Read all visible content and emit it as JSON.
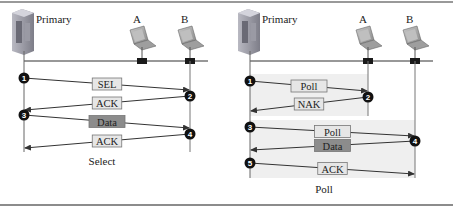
{
  "panels": [
    {
      "id": "select",
      "caption": "Select",
      "primary_label": "Primary",
      "stations": [
        {
          "label": "A"
        },
        {
          "label": "B"
        }
      ],
      "messages": [
        {
          "step": "1",
          "text": "SEL",
          "from": "Primary",
          "to": "B",
          "style": "light"
        },
        {
          "step": "2",
          "text": "ACK",
          "from": "B",
          "to": "Primary",
          "style": "light"
        },
        {
          "step": "3",
          "text": "Data",
          "from": "Primary",
          "to": "B",
          "style": "dark"
        },
        {
          "step": "4",
          "text": "ACK",
          "from": "B",
          "to": "Primary",
          "style": "light"
        }
      ]
    },
    {
      "id": "poll",
      "caption": "Poll",
      "primary_label": "Primary",
      "stations": [
        {
          "label": "A"
        },
        {
          "label": "B"
        }
      ],
      "messages": [
        {
          "step": "1",
          "text": "Poll",
          "from": "Primary",
          "to": "A",
          "style": "light"
        },
        {
          "step": "2",
          "text": "NAK",
          "from": "A",
          "to": "Primary",
          "style": "light"
        },
        {
          "step": "3",
          "text": "Poll",
          "from": "Primary",
          "to": "B",
          "style": "light"
        },
        {
          "step": "4",
          "text": "Data",
          "from": "B",
          "to": "Primary",
          "style": "dark"
        },
        {
          "step": "5",
          "text": "ACK",
          "from": "Primary",
          "to": "B",
          "style": "light"
        }
      ]
    }
  ],
  "colors": {
    "light_box": "#e6e6e6",
    "dark_box": "#8c8c8c",
    "shade": "#efefef",
    "step_circle": "#111111",
    "line": "#333333",
    "frame": "#666666"
  }
}
